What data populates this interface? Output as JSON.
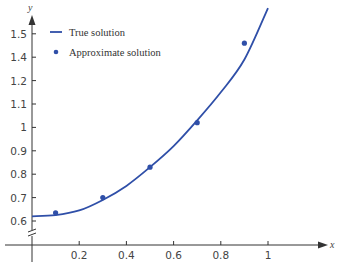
{
  "chart_data": {
    "type": "line",
    "title": "",
    "xlabel": "x",
    "ylabel": "y",
    "x_ticks": [
      {
        "label": "0.2",
        "value": 0.2
      },
      {
        "label": "0.4",
        "value": 0.4
      },
      {
        "label": "0.6",
        "value": 0.6
      },
      {
        "label": "0.8",
        "value": 0.8
      },
      {
        "label": "1",
        "value": 1.0
      }
    ],
    "y_ticks": [
      {
        "label": "0.6",
        "pos": 0
      },
      {
        "label": "0.7",
        "pos": 1
      },
      {
        "label": "0.8",
        "pos": 2
      },
      {
        "label": "0.9",
        "pos": 3
      },
      {
        "label": "1",
        "pos": 4
      },
      {
        "label": "1.1",
        "pos": 5
      },
      {
        "label": "1.2",
        "pos": 6
      },
      {
        "label": "1.4",
        "pos": 7
      },
      {
        "label": "1.5",
        "pos": 8
      }
    ],
    "y_axis_break": true,
    "xlim": [
      0,
      1.1
    ],
    "ylim": [
      0.55,
      1.55
    ],
    "grid": false,
    "legend_position": "upper-left",
    "series": [
      {
        "name": "True solution",
        "style": "line",
        "color": "#2f4fa8",
        "x": [
          0,
          0.1,
          0.2,
          0.3,
          0.4,
          0.5,
          0.6,
          0.7,
          0.8,
          0.9,
          1.0
        ],
        "y": [
          0.62,
          0.625,
          0.645,
          0.69,
          0.75,
          0.83,
          0.92,
          1.03,
          1.15,
          1.29,
          1.51
        ]
      },
      {
        "name": "Approximate solution",
        "style": "markers",
        "color": "#2f4fa8",
        "x": [
          0.1,
          0.3,
          0.5,
          0.7,
          0.9
        ],
        "y": [
          0.635,
          0.7,
          0.83,
          1.02,
          1.36
        ]
      }
    ]
  },
  "legend": {
    "items": [
      {
        "label": "True solution",
        "marker": "line"
      },
      {
        "label": "Approximate solution",
        "marker": "dot"
      }
    ]
  },
  "colors": {
    "series": "#2f4fa8",
    "axis": "#333333",
    "text": "#444444"
  }
}
